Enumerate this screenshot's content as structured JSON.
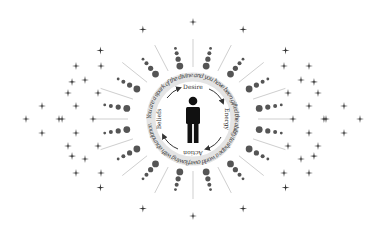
{
  "diagram": {
    "center": {
      "x": 193,
      "y": 119
    },
    "ring": {
      "radius": 42,
      "width": 9,
      "color": "#e2e2e2",
      "text": "You are a spark of the divine and you have been gifted the ability to shape a world overflowing with abundance."
    },
    "cycle_labels": [
      {
        "label": "Desire",
        "angle": 0
      },
      {
        "label": "Energy",
        "angle": 90
      },
      {
        "label": "Action",
        "angle": 180
      },
      {
        "label": "Beliefs",
        "angle": 270
      }
    ],
    "center_icon": "person-icon",
    "arrow_icon": "curved-arrow-icon",
    "colors": {
      "figure": "#111111",
      "dots": "#555555",
      "lines": "#cfcfcf",
      "stars": "#333333",
      "arrows": "#333333"
    }
  }
}
